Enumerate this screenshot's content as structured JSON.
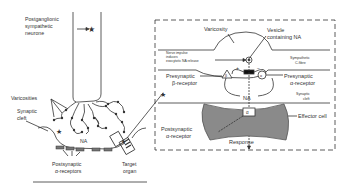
{
  "figure": {
    "left_panel": {
      "labels": {
        "neurone": [
          "Postganglionic",
          "sympathetic",
          "neurone"
        ],
        "varicosities": "Varicosities",
        "synaptic_cleft": [
          "Synaptic",
          "cleft"
        ],
        "na": "NA",
        "postsynaptic_receptors": [
          "Postsynaptic",
          "α-receptors"
        ],
        "target_organ": [
          "Target",
          "organ"
        ]
      }
    },
    "inset_panel": {
      "labels": {
        "varicosity": "Varicosity",
        "vesicle": [
          "Vesicle",
          "containing NA"
        ],
        "nerve_impulse": [
          "Nerve impulse",
          "induces",
          "exocytotic NA release"
        ],
        "sympathetic_fibre": [
          "Sympathetic",
          "C-fibre"
        ],
        "presynaptic_beta": [
          "Presynaptic",
          "β-receptor"
        ],
        "presynaptic_alpha": [
          "Presynaptic",
          "α-receptor"
        ],
        "plus_sign": "+",
        "minus_sign": "−",
        "na": "NA",
        "synaptic_cleft": [
          "Synaptic",
          "cleft"
        ],
        "effector_cell": "Effector cell",
        "alpha_box": "α",
        "postsynaptic_alpha": [
          "Postsynaptic",
          "α-receptor"
        ],
        "response": "Response",
        "beta_glyph": "β",
        "alpha_glyph": "α"
      }
    },
    "colors": {
      "line": "#333333",
      "effector_fill": "#8a8a8a",
      "background": "#ffffff"
    }
  }
}
